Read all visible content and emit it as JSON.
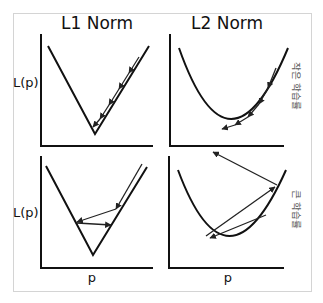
{
  "titles": {
    "l1": "L1 Norm",
    "l2": "L2 Norm"
  },
  "axis_labels": {
    "y_top": "L(p)",
    "y_bottom": "L(p)",
    "x_left": "p",
    "x_right": "p"
  },
  "row_labels": {
    "small_lr": "작은 학습률",
    "large_lr": "큰 학습률"
  },
  "panels": [
    {
      "id": "l1-small-lr",
      "curve": "V-shape (|p|)",
      "steps": "many small steps down the right slope converging to minimum"
    },
    {
      "id": "l2-small-lr",
      "curve": "parabola (p^2)",
      "steps": "many small steps along right side converging to minimum"
    },
    {
      "id": "l1-large-lr",
      "curve": "V-shape (|p|)",
      "steps": "large steps oscillating across the V without reaching minimum"
    },
    {
      "id": "l2-large-lr",
      "curve": "parabola (p^2)",
      "steps": "large steps overshooting and diverging up the walls"
    }
  ],
  "colors": {
    "line": "#111111",
    "frame": "#d4d4d4",
    "side_label": "#555555"
  }
}
